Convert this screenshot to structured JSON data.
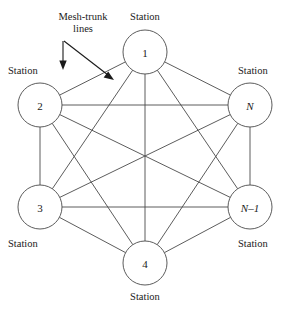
{
  "figure": {
    "kind": "mesh-network-topology-diagram",
    "background_color": "#ffffff",
    "line_color": "#4a4a4a",
    "text_color": "#1a1a1a"
  },
  "annotation": {
    "label_line1": "Mesh-trunk",
    "label_line2": "lines",
    "arrow_count": 2
  },
  "nodes": [
    {
      "id": "n1",
      "label": "1",
      "italic": false,
      "cx": 145,
      "cy": 52,
      "r": 22,
      "caption": "Station",
      "caption_position": "top"
    },
    {
      "id": "n2",
      "label": "2",
      "italic": false,
      "cx": 40,
      "cy": 105,
      "r": 22,
      "caption": "Station",
      "caption_position": "top-left"
    },
    {
      "id": "n3",
      "label": "3",
      "italic": false,
      "cx": 40,
      "cy": 207,
      "r": 22,
      "caption": "Station",
      "caption_position": "bottom-left"
    },
    {
      "id": "n4",
      "label": "4",
      "italic": false,
      "cx": 145,
      "cy": 263,
      "r": 22,
      "caption": "Station",
      "caption_position": "bottom"
    },
    {
      "id": "nNm1",
      "label": "N–1",
      "italic": true,
      "cx": 250,
      "cy": 207,
      "r": 22,
      "caption": "Station",
      "caption_position": "bottom-right"
    },
    {
      "id": "nN",
      "label": "N",
      "italic": true,
      "cx": 250,
      "cy": 105,
      "r": 22,
      "caption": "Station",
      "caption_position": "top-right"
    }
  ],
  "edges": [
    {
      "from": "n1",
      "to": "n2"
    },
    {
      "from": "n1",
      "to": "n3"
    },
    {
      "from": "n1",
      "to": "n4"
    },
    {
      "from": "n1",
      "to": "nNm1"
    },
    {
      "from": "n1",
      "to": "nN"
    },
    {
      "from": "n2",
      "to": "n3"
    },
    {
      "from": "n2",
      "to": "n4"
    },
    {
      "from": "n2",
      "to": "nNm1"
    },
    {
      "from": "n2",
      "to": "nN"
    },
    {
      "from": "n3",
      "to": "n4"
    },
    {
      "from": "n3",
      "to": "nNm1"
    },
    {
      "from": "n3",
      "to": "nN"
    },
    {
      "from": "n4",
      "to": "nNm1"
    },
    {
      "from": "n4",
      "to": "nN"
    },
    {
      "from": "nNm1",
      "to": "nN"
    }
  ],
  "captions": {
    "top": "Station",
    "top_left": "Station",
    "top_right": "Station",
    "bottom_left": "Station",
    "bottom_right": "Station",
    "bottom": "Station"
  }
}
